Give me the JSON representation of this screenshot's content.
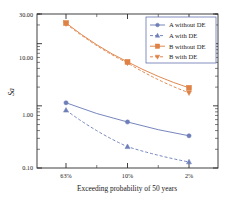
{
  "chart_data": {
    "type": "line",
    "title": "",
    "xlabel": "Exceeding probability of 50 years",
    "ylabel": "Sa",
    "categories": [
      "63%",
      "10%",
      "2%"
    ],
    "yscale": "log",
    "ylim": [
      0.1,
      30.0
    ],
    "ytick_labels": [
      "0.10",
      "1.00",
      "10.00",
      "30.00"
    ],
    "ytick_values": [
      0.1,
      1.0,
      10.0,
      30.0
    ],
    "grid": false,
    "legend_position": "top-right",
    "series": [
      {
        "name": "A without DE",
        "values": [
          1.12,
          0.55,
          0.33
        ],
        "color": "#6E7FB8",
        "marker": "circle",
        "linestyle": "solid"
      },
      {
        "name": "A with DE",
        "values": [
          0.85,
          0.22,
          0.125
        ],
        "color": "#6E7FB8",
        "marker": "triangle-up",
        "linestyle": "dashed"
      },
      {
        "name": "B without DE",
        "values": [
          21.5,
          5.1,
          1.95
        ],
        "color": "#DE8246",
        "marker": "square",
        "linestyle": "solid"
      },
      {
        "name": "B with DE",
        "values": [
          21.0,
          4.9,
          1.62
        ],
        "color": "#DE8246",
        "marker": "triangle-down",
        "linestyle": "dashed"
      }
    ]
  },
  "axes": {
    "ylabel_text": "Sa",
    "xlabel_text": "Exceeding probability of 50 years",
    "xtick_0": "63%",
    "xtick_1": "10%",
    "xtick_2": "2%",
    "ytick_0": "0.10",
    "ytick_1": "1.00",
    "ytick_2": "10.00",
    "ytick_3": "30.00"
  },
  "legend": {
    "items": [
      {
        "label": "A without DE"
      },
      {
        "label": "A with DE"
      },
      {
        "label": "B without DE"
      },
      {
        "label": "B with DE"
      }
    ]
  }
}
